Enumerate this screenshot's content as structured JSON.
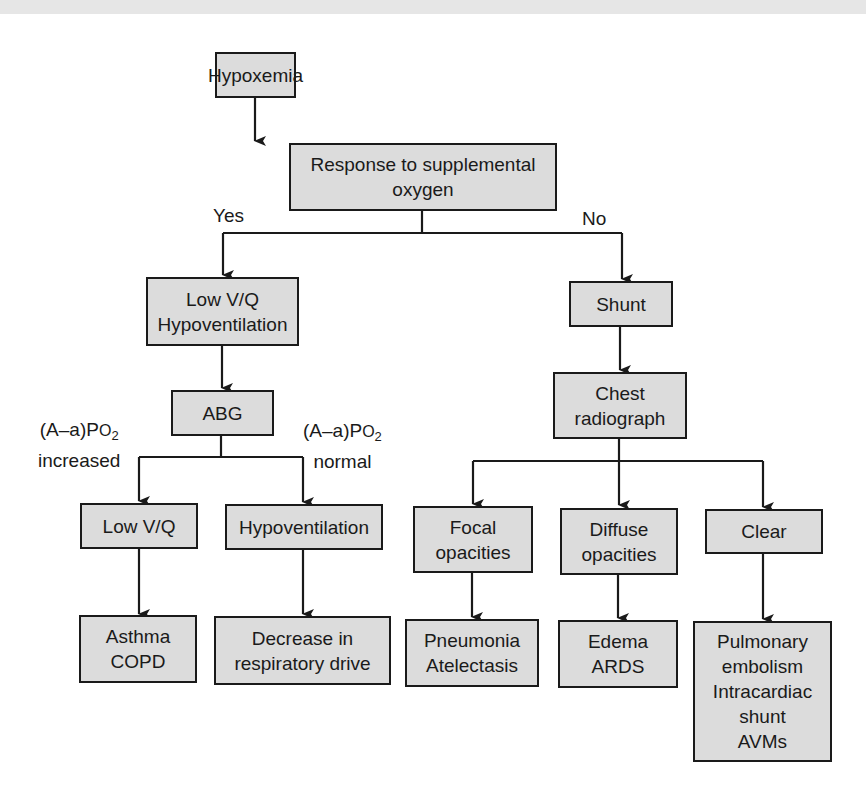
{
  "diagram": {
    "title": "Hypoxemia",
    "colors": {
      "box_fill": "#dcdcdc",
      "box_border": "#1a1a1a",
      "line": "#1a1a1a",
      "background": "#ffffff",
      "top_band": "#e6e6e6"
    },
    "nodes": {
      "hypoxemia": "Hypoxemia",
      "response": "Response to supplemental\noxygen",
      "lowvq_hypo": "Low V/Q\nHypoventilation",
      "abg": "ABG",
      "lowvq": "Low V/Q",
      "hypoventilation": "Hypoventilation",
      "asthma_copd": "Asthma\nCOPD",
      "decrease_drive": "Decrease in\nrespiratory drive",
      "shunt": "Shunt",
      "chest_radiograph": "Chest\nradiograph",
      "focal": "Focal\nopacities",
      "diffuse": "Diffuse\nopacities",
      "clear": "Clear",
      "pneumonia": "Pneumonia\nAtelectasis",
      "edema": "Edema\nARDS",
      "pulmonary": "Pulmonary\nembolism\nIntracardiac\nshunt\nAVMs"
    },
    "edge_labels": {
      "yes": "Yes",
      "no": "No",
      "aa_increased_line1_prefix": "(A–a)P",
      "aa_increased_line1_o": "O",
      "aa_increased_line1_sub": "2",
      "aa_increased_line2": "increased",
      "aa_normal_line1_prefix": "(A–a)P",
      "aa_normal_line1_o": "O",
      "aa_normal_line1_sub": "2",
      "aa_normal_line2": "normal"
    },
    "edges": [
      {
        "from": "Hypoxemia",
        "to": "Response to supplemental oxygen"
      },
      {
        "from": "Response to supplemental oxygen",
        "to": "Low V/Q Hypoventilation",
        "label": "Yes"
      },
      {
        "from": "Response to supplemental oxygen",
        "to": "Shunt",
        "label": "No"
      },
      {
        "from": "Low V/Q Hypoventilation",
        "to": "ABG"
      },
      {
        "from": "ABG",
        "to": "Low V/Q",
        "label": "(A–a)PO2 increased"
      },
      {
        "from": "ABG",
        "to": "Hypoventilation",
        "label": "(A–a)PO2 normal"
      },
      {
        "from": "Low V/Q",
        "to": "Asthma COPD"
      },
      {
        "from": "Hypoventilation",
        "to": "Decrease in respiratory drive"
      },
      {
        "from": "Shunt",
        "to": "Chest radiograph"
      },
      {
        "from": "Chest radiograph",
        "to": "Focal opacities"
      },
      {
        "from": "Chest radiograph",
        "to": "Diffuse opacities"
      },
      {
        "from": "Chest radiograph",
        "to": "Clear"
      },
      {
        "from": "Focal opacities",
        "to": "Pneumonia Atelectasis"
      },
      {
        "from": "Diffuse opacities",
        "to": "Edema ARDS"
      },
      {
        "from": "Clear",
        "to": "Pulmonary embolism Intracardiac shunt AVMs"
      }
    ]
  }
}
